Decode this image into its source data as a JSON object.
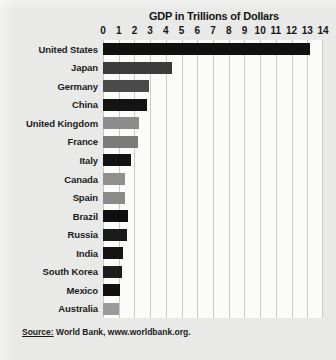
{
  "chart_data": {
    "type": "bar",
    "orientation": "horizontal",
    "title": "GDP in Trillions of Dollars",
    "xlabel": "",
    "ylabel": "",
    "xlim": [
      0,
      14
    ],
    "xticks": [
      0,
      1,
      2,
      3,
      4,
      5,
      6,
      7,
      8,
      9,
      10,
      11,
      12,
      13,
      14
    ],
    "xtick_labels": [
      "0",
      "1",
      "2",
      "3",
      "4",
      "5",
      "6",
      "7",
      "8",
      "9",
      "10",
      "11",
      "12",
      "13",
      "14"
    ],
    "grid": true,
    "grid_axis": "x",
    "legend": "none",
    "categories": [
      "United States",
      "Japan",
      "Germany",
      "China",
      "United Kingdom",
      "France",
      "Italy",
      "Canada",
      "Spain",
      "Brazil",
      "Russia",
      "India",
      "South Korea",
      "Mexico",
      "Australia"
    ],
    "values": [
      13.2,
      4.4,
      2.9,
      2.8,
      2.3,
      2.2,
      1.8,
      1.4,
      1.4,
      1.6,
      1.5,
      1.3,
      1.2,
      1.1,
      1.0
    ],
    "bar_colors": [
      "#111111",
      "#3b3b3b",
      "#4a4a4a",
      "#141414",
      "#8c8c8c",
      "#7b7b7b",
      "#111111",
      "#8f8f8f",
      "#8a8a8a",
      "#0f0f0f",
      "#1a1a1a",
      "#141414",
      "#1d1d1d",
      "#111111",
      "#9a9a9a"
    ],
    "source": "Source: World Bank, www.worldbank.org.",
    "source_prefix": "Source:",
    "source_rest": " World Bank, www.worldbank.org."
  },
  "colors": {
    "page_background": "#e9e9e7",
    "plot_background": "#fbfbfa",
    "gridline": "#c9c9c6",
    "text": "#151515"
  }
}
